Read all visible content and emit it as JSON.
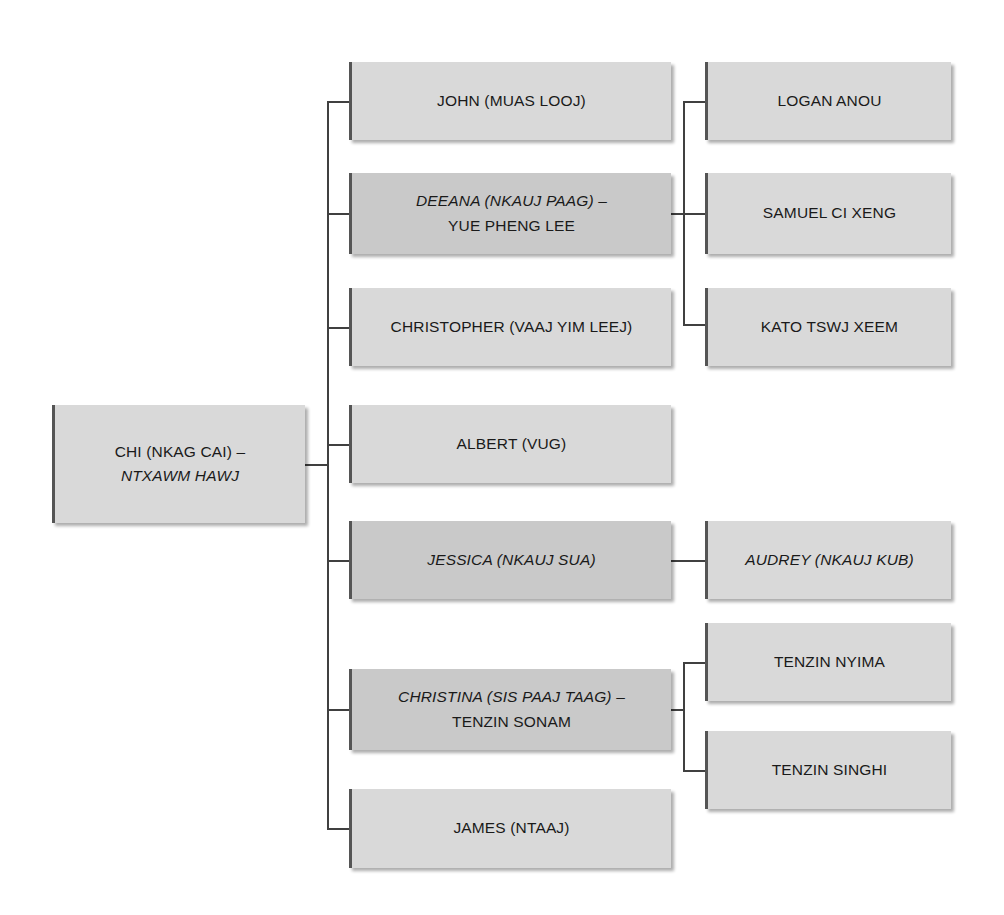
{
  "diagram": {
    "colors": {
      "box_light": "#d9d9d9",
      "box_dark": "#c9c9c9",
      "edge_accent": "#555555",
      "connector": "#404040",
      "text": "#1a1a1a",
      "background": "#ffffff"
    }
  },
  "nodes": {
    "root": {
      "name": "chi",
      "lines": [
        {
          "text": "CHI (NKAG CAI) –",
          "italic": false
        },
        {
          "text": "NTXAWM HAWJ",
          "italic": true
        }
      ],
      "shade": "light"
    },
    "children": [
      {
        "name": "john",
        "lines": [
          {
            "text": "JOHN (MUAS LOOJ)",
            "italic": false
          }
        ],
        "shade": "light"
      },
      {
        "name": "deeana",
        "lines": [
          {
            "text": "DEEANA (NKAUJ PAAG) –",
            "italic": true
          },
          {
            "text": "YUE PHENG LEE",
            "italic": false
          }
        ],
        "shade": "dark"
      },
      {
        "name": "christopher",
        "lines": [
          {
            "text": "CHRISTOPHER (VAAJ YIM LEEJ)",
            "italic": false
          }
        ],
        "shade": "light"
      },
      {
        "name": "albert",
        "lines": [
          {
            "text": "ALBERT (VUG)",
            "italic": false
          }
        ],
        "shade": "light"
      },
      {
        "name": "jessica",
        "lines": [
          {
            "text": "JESSICA (NKAUJ SUA)",
            "italic": true
          }
        ],
        "shade": "dark"
      },
      {
        "name": "christina",
        "lines": [
          {
            "text": "CHRISTINA (SIS PAAJ TAAG) –",
            "italic": true
          },
          {
            "text": "TENZIN SONAM",
            "italic": false
          }
        ],
        "shade": "dark"
      },
      {
        "name": "james",
        "lines": [
          {
            "text": "JAMES (NTAAJ)",
            "italic": false
          }
        ],
        "shade": "light"
      }
    ],
    "grandchildren": [
      {
        "name": "logan",
        "parent": "deeana",
        "lines": [
          {
            "text": "LOGAN ANOU",
            "italic": false
          }
        ],
        "shade": "light"
      },
      {
        "name": "samuel",
        "parent": "deeana",
        "lines": [
          {
            "text": "SAMUEL CI XENG",
            "italic": false
          }
        ],
        "shade": "light"
      },
      {
        "name": "kato",
        "parent": "deeana",
        "lines": [
          {
            "text": "KATO TSWJ XEEM",
            "italic": false
          }
        ],
        "shade": "light"
      },
      {
        "name": "audrey",
        "parent": "jessica",
        "lines": [
          {
            "text": "AUDREY (NKAUJ KUB)",
            "italic": true
          }
        ],
        "shade": "light"
      },
      {
        "name": "tenzin-nyima",
        "parent": "christina",
        "lines": [
          {
            "text": "TENZIN NYIMA",
            "italic": false
          }
        ],
        "shade": "light"
      },
      {
        "name": "tenzin-singhi",
        "parent": "christina",
        "lines": [
          {
            "text": "TENZIN SINGHI",
            "italic": false
          }
        ],
        "shade": "light"
      }
    ]
  }
}
